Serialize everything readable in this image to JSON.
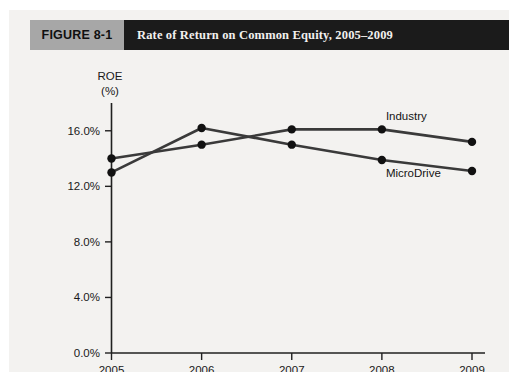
{
  "figure": {
    "number_label": "FIGURE 8-1",
    "title": "Rate of Return on Common Equity, 2005–2009",
    "header_bg": "#1b1b1b",
    "number_bg": "#a7a7a7",
    "panel_bg": "#f3f2f0"
  },
  "chart_data": {
    "type": "line",
    "title": "Rate of Return on Common Equity, 2005–2009",
    "xlabel": "",
    "ylabel": "ROE",
    "ylabel_line2": "(%)",
    "x": [
      "2005",
      "2006",
      "2007",
      "2008",
      "2009"
    ],
    "categories": [
      "2005",
      "2006",
      "2007",
      "2008",
      "2009"
    ],
    "series": [
      {
        "name": "Industry",
        "values": [
          14.0,
          15.0,
          16.1,
          16.1,
          15.2
        ],
        "color": "#3a3a3a"
      },
      {
        "name": "MicroDrive",
        "values": [
          13.0,
          16.2,
          15.0,
          13.9,
          13.1
        ],
        "color": "#3a3a3a"
      }
    ],
    "ylim": [
      0.0,
      18.0
    ],
    "yticks": [
      0.0,
      4.0,
      8.0,
      12.0,
      16.0
    ],
    "ytick_labels": [
      "0.0%",
      "4.0%",
      "8.0%",
      "12.0%",
      "16.0%"
    ],
    "xtick_labels": [
      "2005",
      "2006",
      "2007",
      "2008",
      "2009"
    ],
    "grid": false,
    "legend": "inline-annotations",
    "annotations": [
      {
        "text": "Industry",
        "series": "Industry",
        "near_x": "2008"
      },
      {
        "text": "MicroDrive",
        "series": "MicroDrive",
        "near_x": "2008"
      }
    ]
  }
}
